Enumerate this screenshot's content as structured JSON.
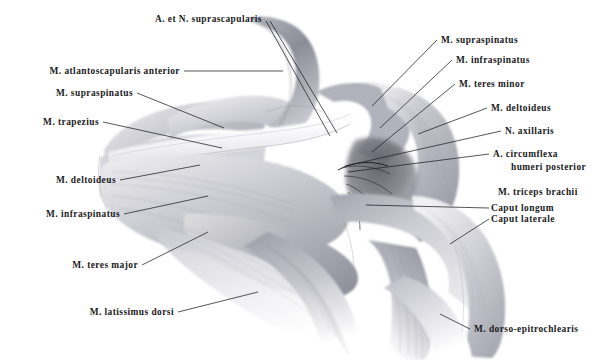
{
  "plate": {
    "title": "Schulterregion — Musculi",
    "background_color": "#ffffff",
    "ink_color": "#1d1d26",
    "width": 611,
    "height": 360
  },
  "illustration": {
    "name": "shoulder-musculature-drawing",
    "medium": "graphite pencil shading",
    "palette": {
      "paper": "#ffffff",
      "light_tone": "#e7e7ea",
      "mid_tone": "#b9b9c0",
      "dark_tone": "#7c7c86",
      "deep_shadow": "#4a4a54"
    }
  },
  "labels": {
    "top_center": {
      "id": "a-et-n-suprascapularis",
      "text": "A. et N. suprascapularis"
    },
    "left": [
      {
        "id": "m-atlantoscapularis-anterior",
        "text": "M. atlantoscapularis anterior"
      },
      {
        "id": "m-supraspinatus-left",
        "text": "M. supraspinatus"
      },
      {
        "id": "m-trapezius",
        "text": "M. trapezius"
      },
      {
        "id": "m-deltoideus-left",
        "text": "M. deltoideus"
      },
      {
        "id": "m-infraspinatus-left",
        "text": "M. infraspinatus"
      },
      {
        "id": "m-teres-major",
        "text": "M. teres major"
      },
      {
        "id": "m-latissimus-dorsi",
        "text": "M. latissimus dorsi"
      }
    ],
    "right": [
      {
        "id": "m-supraspinatus-right",
        "text": "M. supraspinatus"
      },
      {
        "id": "m-infraspinatus-right",
        "text": "M. infraspinatus"
      },
      {
        "id": "m-teres-minor",
        "text": "M. teres minor"
      },
      {
        "id": "m-deltoideus-right",
        "text": "M. deltoideus"
      },
      {
        "id": "n-axillaris",
        "text": "N. axillaris"
      },
      {
        "id": "a-circumflexa-humeri-posterior-1",
        "text": "A. circumflexa"
      },
      {
        "id": "a-circumflexa-humeri-posterior-2",
        "text": "humeri posterior"
      },
      {
        "id": "m-triceps-brachii",
        "text": "M. triceps brachii"
      },
      {
        "id": "caput-longum",
        "text": "Caput longum"
      },
      {
        "id": "caput-laterale",
        "text": "Caput laterale"
      },
      {
        "id": "m-dorso-epitrochlearis",
        "text": "M. dorso-epitrochlearis"
      }
    ]
  }
}
